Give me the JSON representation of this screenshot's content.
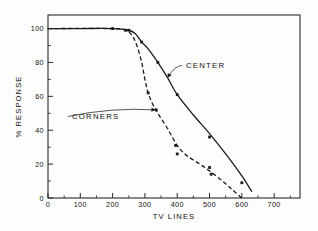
{
  "chart_data": {
    "type": "line",
    "title": "",
    "xlabel": "TV LINES",
    "ylabel": "% RESPONSE",
    "xlim": [
      0,
      780
    ],
    "ylim": [
      0,
      108
    ],
    "grid": false,
    "legend_position": "inline-annotations",
    "x_ticks": [
      0,
      100,
      200,
      300,
      400,
      500,
      600,
      700
    ],
    "x_tick_labels": [
      "0",
      "100",
      "200",
      "300",
      "400",
      "500",
      "600",
      "700"
    ],
    "x_minor_tick_step": 50,
    "y_ticks": [
      0,
      20,
      40,
      60,
      80,
      100
    ],
    "y_tick_labels": [
      "0",
      "20",
      "40",
      "60",
      "80",
      "100"
    ],
    "y_minor_tick_step": 10,
    "series": [
      {
        "name": "CENTER",
        "style": "solid",
        "marker": "square",
        "points": [
          {
            "x": 0,
            "y": 100
          },
          {
            "x": 100,
            "y": 100
          },
          {
            "x": 200,
            "y": 100
          },
          {
            "x": 250,
            "y": 99
          },
          {
            "x": 270,
            "y": 97
          },
          {
            "x": 290,
            "y": 92
          },
          {
            "x": 310,
            "y": 88
          },
          {
            "x": 340,
            "y": 80
          },
          {
            "x": 370,
            "y": 71
          },
          {
            "x": 400,
            "y": 61
          },
          {
            "x": 450,
            "y": 49
          },
          {
            "x": 500,
            "y": 38
          },
          {
            "x": 550,
            "y": 26
          },
          {
            "x": 600,
            "y": 13
          },
          {
            "x": 630,
            "y": 4
          }
        ],
        "data_markers": [
          {
            "x": 200,
            "y": 100
          },
          {
            "x": 250,
            "y": 99
          },
          {
            "x": 290,
            "y": 92
          },
          {
            "x": 340,
            "y": 80
          },
          {
            "x": 400,
            "y": 61
          },
          {
            "x": 500,
            "y": 36
          },
          {
            "x": 600,
            "y": 9
          }
        ]
      },
      {
        "name": "CORNERS",
        "style": "dashed",
        "marker": "square",
        "points": [
          {
            "x": 0,
            "y": 100
          },
          {
            "x": 200,
            "y": 100
          },
          {
            "x": 240,
            "y": 99
          },
          {
            "x": 260,
            "y": 96
          },
          {
            "x": 275,
            "y": 90
          },
          {
            "x": 290,
            "y": 80
          },
          {
            "x": 300,
            "y": 70
          },
          {
            "x": 310,
            "y": 62
          },
          {
            "x": 325,
            "y": 55
          },
          {
            "x": 340,
            "y": 50
          },
          {
            "x": 370,
            "y": 41
          },
          {
            "x": 400,
            "y": 31
          },
          {
            "x": 430,
            "y": 25
          },
          {
            "x": 470,
            "y": 20
          },
          {
            "x": 500,
            "y": 16
          },
          {
            "x": 540,
            "y": 10
          },
          {
            "x": 570,
            "y": 5
          },
          {
            "x": 600,
            "y": 0
          }
        ],
        "data_markers": [
          {
            "x": 240,
            "y": 99
          },
          {
            "x": 310,
            "y": 62
          },
          {
            "x": 335,
            "y": 52
          },
          {
            "x": 395,
            "y": 31
          },
          {
            "x": 400,
            "y": 26
          },
          {
            "x": 500,
            "y": 18
          },
          {
            "x": 505,
            "y": 14
          }
        ]
      }
    ],
    "annotations": [
      {
        "text": "CENTER",
        "label_x": 186,
        "label_y": 68,
        "target": {
          "x": 370,
          "y": 71
        },
        "anchor": "start"
      },
      {
        "text": "CORNERS",
        "label_x": 72,
        "label_y": 119,
        "target": {
          "x": 333,
          "y": 52
        },
        "anchor": "start"
      }
    ]
  }
}
